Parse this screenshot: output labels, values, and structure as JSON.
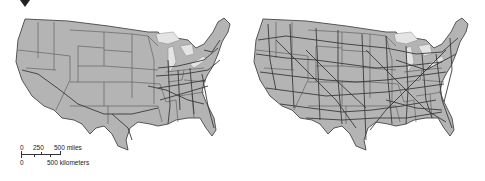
{
  "figure": {
    "marker": "triangle-down",
    "maps": [
      {
        "id": "left",
        "description": "Contiguous United States with sparse network (fewer routes)",
        "network_density": "sparse"
      },
      {
        "id": "right",
        "description": "Contiguous United States with dense network (many routes)",
        "network_density": "dense"
      }
    ],
    "colors": {
      "land": "#b4b4b4",
      "lakes": "#e4e4e4",
      "borders": "#555555",
      "routes": "#3a3a3a",
      "background": "#ffffff"
    }
  },
  "scale_bar": {
    "miles_labels": [
      "0",
      "250",
      "500 miles"
    ],
    "km_labels": [
      "0",
      "500 kilometers"
    ]
  }
}
